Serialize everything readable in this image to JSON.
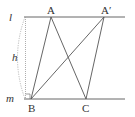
{
  "diagram": {
    "type": "geometry",
    "lines": {
      "l": {
        "label": "l",
        "y": 17,
        "x1": 24,
        "x2": 125
      },
      "m": {
        "label": "m",
        "y": 99,
        "x1": 24,
        "x2": 125
      }
    },
    "points": {
      "A": {
        "label": "A",
        "x": 51,
        "y": 17
      },
      "A_prime": {
        "label": "A′",
        "x": 104,
        "y": 17
      },
      "B": {
        "label": "B",
        "x": 31,
        "y": 99
      },
      "C": {
        "label": "C",
        "x": 86,
        "y": 99
      }
    },
    "segments": [
      {
        "from": "A",
        "to": "B"
      },
      {
        "from": "A",
        "to": "C"
      },
      {
        "from": "A_prime",
        "to": "B"
      },
      {
        "from": "A_prime",
        "to": "C"
      }
    ],
    "height": {
      "label": "h"
    },
    "right_angle_marker": {
      "at": "foot of height on m"
    },
    "colors": {
      "line": "#555555",
      "dotted": "#999999",
      "text": "#333333"
    }
  }
}
